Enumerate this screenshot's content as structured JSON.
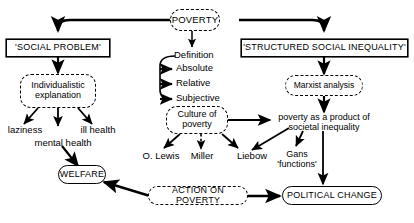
{
  "diagram": {
    "title": "POVERTY",
    "type": "concept-map",
    "background_color": "#ffffff",
    "line_color": "#000000",
    "text_color": "#000000"
  },
  "nodes": {
    "poverty": {
      "label": "POVERTY",
      "style": "round-dashed"
    },
    "social_problem": {
      "label": "'SOCIAL PROBLEM'",
      "style": "rect-solid"
    },
    "structured_social_inequality": {
      "label": "'STRUCTURED SOCIAL INEQUALITY'",
      "style": "rect-solid"
    },
    "definition": {
      "label": "Definition",
      "style": "plain"
    },
    "absolute": {
      "label": "Absolute",
      "style": "plain"
    },
    "relative": {
      "label": "Relative",
      "style": "plain"
    },
    "subjective": {
      "label": "Subjective",
      "style": "plain"
    },
    "individualistic_explanation": {
      "label": "Individualistic\nexplanation",
      "style": "round-dashed"
    },
    "marxist_analysis": {
      "label": "Marxist analysis",
      "style": "round-dashed"
    },
    "laziness": {
      "label": "laziness",
      "style": "plain"
    },
    "mental_health": {
      "label": "mental health",
      "style": "plain"
    },
    "ill_health": {
      "label": "ill health",
      "style": "plain"
    },
    "culture_of_poverty": {
      "label": "Culture of\npoverty",
      "style": "round-dashed"
    },
    "poverty_product": {
      "label": "poverty as a product of\nsocietal inequality",
      "style": "plain"
    },
    "o_lewis": {
      "label": "O. Lewis",
      "style": "plain"
    },
    "miller": {
      "label": "Miller",
      "style": "plain"
    },
    "liebow": {
      "label": "Liebow",
      "style": "plain"
    },
    "gans_functions": {
      "label": "Gans\n'functions'",
      "style": "plain"
    },
    "welfare": {
      "label": "WELFARE",
      "style": "round-solid"
    },
    "action_on_poverty": {
      "label": "ACTION ON POVERTY",
      "style": "round-dashed"
    },
    "political_change": {
      "label": "POLITICAL CHANGE",
      "style": "round-solid"
    }
  }
}
